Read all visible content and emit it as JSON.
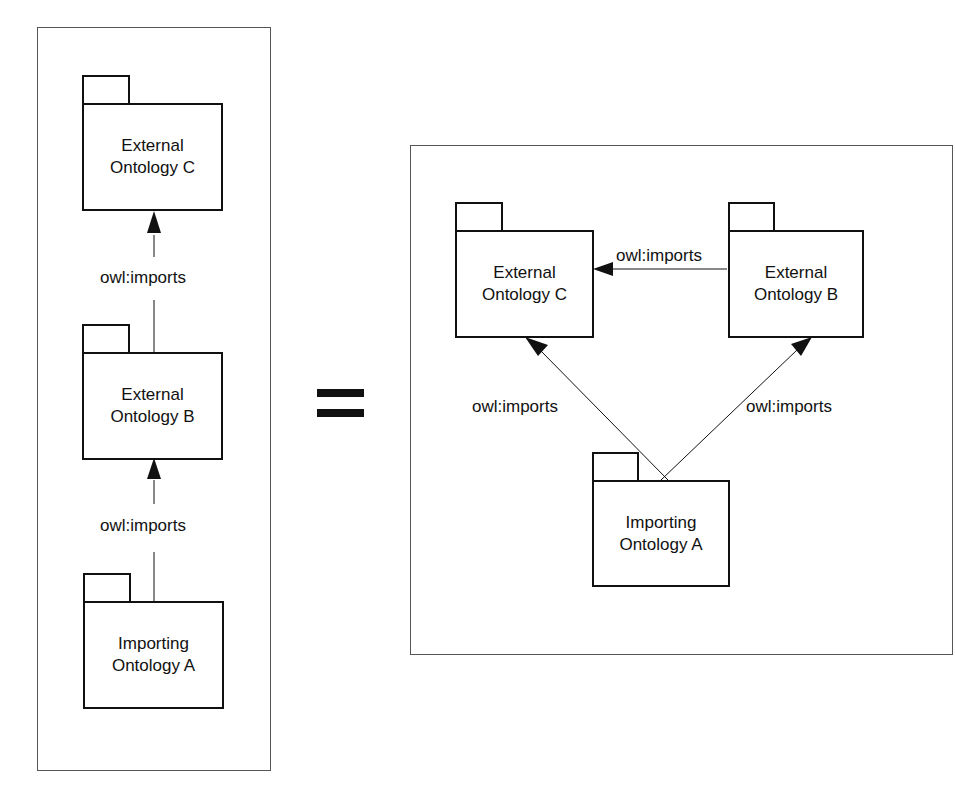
{
  "left_diagram": {
    "packages": [
      {
        "id": "C",
        "line1": "External",
        "line2": "Ontology C"
      },
      {
        "id": "B",
        "line1": "External",
        "line2": "Ontology B"
      },
      {
        "id": "A",
        "line1": "Importing",
        "line2": "Ontology A"
      }
    ],
    "edges": [
      {
        "from": "B",
        "to": "C",
        "label": "owl:imports"
      },
      {
        "from": "A",
        "to": "B",
        "label": "owl:imports"
      }
    ]
  },
  "equals_sign": "=",
  "right_diagram": {
    "packages": [
      {
        "id": "C",
        "line1": "External",
        "line2": "Ontology C"
      },
      {
        "id": "B",
        "line1": "External",
        "line2": "Ontology B"
      },
      {
        "id": "A",
        "line1": "Importing",
        "line2": "Ontology A"
      }
    ],
    "edges": [
      {
        "from": "B",
        "to": "C",
        "label": "owl:imports"
      },
      {
        "from": "A",
        "to": "C",
        "label": "owl:imports"
      },
      {
        "from": "A",
        "to": "B",
        "label": "owl:imports"
      }
    ]
  }
}
